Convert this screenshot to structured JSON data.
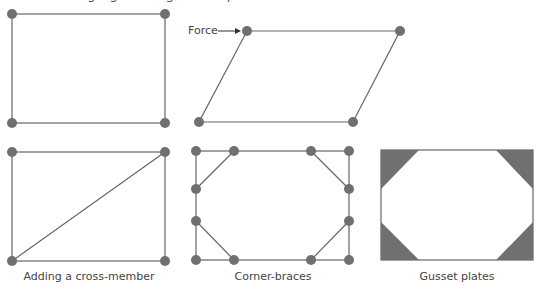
{
  "top_caption": "...ing rigid triangles and plates to stiffen a frame...",
  "colors": {
    "line": "#666666",
    "node": "#707070",
    "plate": "#707070"
  },
  "frames": [
    {
      "id": "square-frame",
      "caption": ""
    },
    {
      "id": "deformed-frame",
      "caption": "",
      "force_label": "Force"
    },
    {
      "id": "cross-member-frame",
      "caption": "Adding a cross-member"
    },
    {
      "id": "corner-braces-frame",
      "caption": "Corner-braces"
    },
    {
      "id": "gusset-plates-frame",
      "caption": "Gusset plates"
    }
  ]
}
